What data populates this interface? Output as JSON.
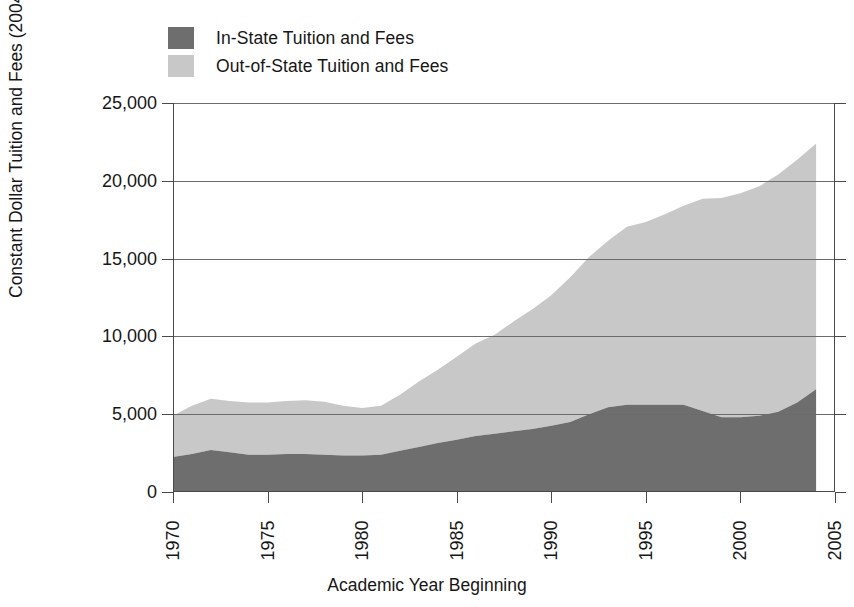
{
  "chart_data": {
    "type": "area",
    "title": "",
    "subtitle": "",
    "xlabel": "Academic Year Beginning",
    "ylabel": "Constant Dollar Tuition and Fees (2004)",
    "stacked": true,
    "grid": true,
    "legend_position": "top-left",
    "xlim": [
      1970,
      2005
    ],
    "ylim": [
      0,
      25000
    ],
    "x_ticks": [
      1970,
      1975,
      1980,
      1985,
      1990,
      1995,
      2000,
      2005
    ],
    "x_tick_labels": [
      "1970",
      "1975",
      "1980",
      "1985",
      "1990",
      "1995",
      "2000",
      "2005"
    ],
    "y_ticks": [
      0,
      5000,
      10000,
      15000,
      20000,
      25000
    ],
    "y_tick_labels": [
      "0",
      "5,000",
      "10,000",
      "15,000",
      "20,000",
      "25,000"
    ],
    "x": [
      1970,
      1971,
      1972,
      1973,
      1974,
      1975,
      1976,
      1977,
      1978,
      1979,
      1980,
      1981,
      1982,
      1983,
      1984,
      1985,
      1986,
      1987,
      1988,
      1989,
      1990,
      1991,
      1992,
      1993,
      1994,
      1995,
      1996,
      1997,
      1998,
      1999,
      2000,
      2001,
      2002,
      2003,
      2004
    ],
    "series": [
      {
        "name": "In-State Tuition and Fees",
        "color": "#6e6e6e",
        "values": [
          2250,
          2450,
          2700,
          2550,
          2400,
          2400,
          2450,
          2450,
          2400,
          2350,
          2350,
          2400,
          2650,
          2900,
          3150,
          3350,
          3600,
          3750,
          3900,
          4050,
          4250,
          4500,
          5000,
          5450,
          5600,
          5600,
          5600,
          5600,
          5200,
          4800,
          4800,
          4900,
          5150,
          5750,
          6600
        ]
      },
      {
        "name": "Out-of-State Tuition and Fees",
        "color": "#c8c8c8",
        "values": [
          2650,
          3100,
          3300,
          3300,
          3350,
          3350,
          3400,
          3450,
          3400,
          3200,
          3050,
          3150,
          3600,
          4200,
          4700,
          5350,
          5950,
          6350,
          7050,
          7700,
          8400,
          9300,
          10100,
          10700,
          11450,
          11750,
          12250,
          12800,
          13650,
          14100,
          14400,
          14750,
          15250,
          15600,
          15800
        ]
      }
    ],
    "series_totals_note": "values are stacked; second series is the increment above the first",
    "legend": [
      {
        "label": "In-State Tuition and Fees",
        "color": "#6e6e6e"
      },
      {
        "label": "Out-of-State Tuition and Fees",
        "color": "#c8c8c8"
      }
    ]
  }
}
